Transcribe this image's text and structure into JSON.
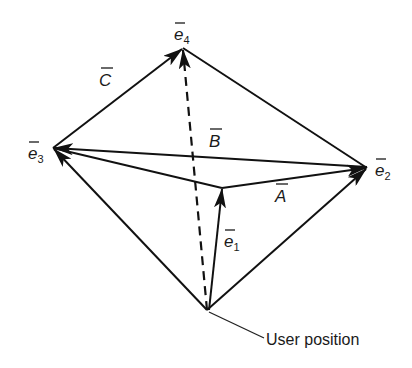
{
  "diagram": {
    "title": "",
    "nodes": [
      {
        "id": "e4",
        "label": "e",
        "sub": "4",
        "x": 183,
        "y": 48
      },
      {
        "id": "e3",
        "label": "e",
        "sub": "3",
        "x": 53,
        "y": 148
      },
      {
        "id": "e2",
        "label": "e",
        "sub": "2",
        "x": 367,
        "y": 168
      },
      {
        "id": "user",
        "label": "User position",
        "x": 207,
        "y": 310
      },
      {
        "id": "e1tip",
        "label": "",
        "x": 222,
        "y": 188
      }
    ],
    "labels": {
      "e4": {
        "base": "e",
        "sub": "4"
      },
      "e3": {
        "base": "e",
        "sub": "3"
      },
      "e2": {
        "base": "e",
        "sub": "2"
      },
      "e1": {
        "base": "e",
        "sub": "1"
      },
      "A": "A",
      "B": "B",
      "C": "C",
      "user_position": "User position"
    },
    "edges": [
      {
        "from": "user",
        "to": "e3",
        "style": "solid",
        "arrow": true
      },
      {
        "from": "user",
        "to": "e2",
        "style": "solid",
        "arrow": true
      },
      {
        "from": "user",
        "to": "e4",
        "style": "dashed",
        "arrow": true
      },
      {
        "from": "user",
        "to": "e1tip",
        "style": "solid",
        "arrow": true,
        "label": "e1"
      },
      {
        "from": "e3",
        "to": "e4",
        "style": "solid",
        "arrow": true,
        "label": "C"
      },
      {
        "from": "e4",
        "to": "e2",
        "style": "solid",
        "arrow": false
      },
      {
        "from": "e2",
        "to": "e3",
        "style": "solid",
        "arrow": true,
        "label": "B"
      },
      {
        "from": "e1tip",
        "to": "e2",
        "style": "solid",
        "arrow": true,
        "label": "A"
      },
      {
        "from": "e3",
        "to": "e1tip",
        "style": "solid",
        "arrow": false
      }
    ]
  }
}
